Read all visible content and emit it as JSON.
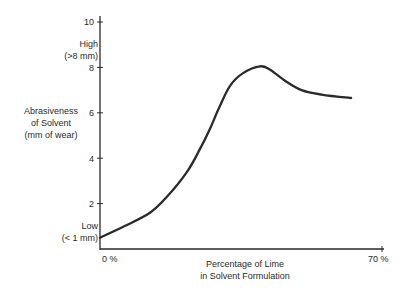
{
  "chart_data": {
    "type": "line",
    "title": "",
    "xlabel": "Percentage of Lime in Solvent Formulation",
    "ylabel": "Abrasiveness of Solvent (mm of wear)",
    "xlim": [
      0,
      70
    ],
    "ylim": [
      0,
      10
    ],
    "x_tick_labels": [
      "0 %",
      "70 %"
    ],
    "y_ticks": [
      2,
      4,
      6,
      8,
      10
    ],
    "grid": false,
    "annotations": [
      {
        "text": "High (>8 mm)",
        "near_y": 8.6
      },
      {
        "text": "Low (< 1 mm)",
        "near_y": 0.7
      }
    ],
    "series": [
      {
        "name": "Abrasiveness",
        "x": [
          0,
          6,
          12.4,
          16.6,
          21.6,
          24.8,
          27.3,
          29.5,
          32.3,
          35.5,
          39.7,
          42.2,
          46,
          50,
          55,
          62.3
        ],
        "y": [
          0.5,
          1.0,
          1.6,
          2.3,
          3.4,
          4.4,
          5.3,
          6.2,
          7.2,
          7.75,
          8.05,
          7.9,
          7.4,
          7.0,
          6.8,
          6.65
        ]
      }
    ]
  },
  "labels": {
    "ylabel_line1": "Abrasiveness",
    "ylabel_line2": "of Solvent",
    "ylabel_line3": "(mm of wear)",
    "high_line1": "High",
    "high_line2": "(>8 mm)",
    "low_line1": "Low",
    "low_line2": "(< 1 mm)",
    "xlabel_line1": "Percentage of Lime",
    "xlabel_line2": "in Solvent Formulation",
    "xtick_0": "0 %",
    "xtick_70": "70 %",
    "ytick_2": "2",
    "ytick_4": "4",
    "ytick_6": "6",
    "ytick_8": "8",
    "ytick_10": "10"
  }
}
